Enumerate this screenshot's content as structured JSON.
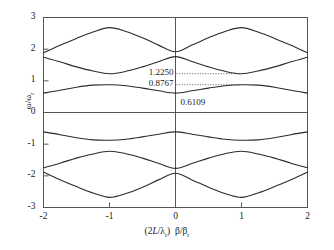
{
  "chart_data": {
    "type": "line",
    "title": "",
    "xlabel": "(2L/λ_r) β/β_r",
    "ylabel": "ω/ω_r",
    "xlim": [
      -2,
      2
    ],
    "ylim": [
      -3,
      3
    ],
    "xticks": [
      -2,
      -1,
      0,
      1,
      2
    ],
    "yticks": [
      3,
      2,
      1,
      0,
      -1,
      -2,
      -3
    ],
    "xtick_labels": [
      "-2",
      "-1",
      "0",
      "1",
      "2"
    ],
    "ytick_labels": [
      "3",
      "2",
      "1",
      "0",
      "-1",
      "-2",
      "-3"
    ],
    "grid": false,
    "legend": "none",
    "zero_line": 0,
    "series": [
      {
        "name": "band-1-upper",
        "x": [
          -2.0,
          -1.75,
          -1.5,
          -1.25,
          -1.0,
          -0.75,
          -0.5,
          -0.25,
          0.0,
          0.25,
          0.5,
          0.75,
          1.0,
          1.25,
          1.5,
          1.75,
          2.0
        ],
        "values": [
          1.88,
          2.12,
          2.34,
          2.54,
          2.68,
          2.56,
          2.36,
          2.12,
          1.92,
          2.13,
          2.36,
          2.56,
          2.68,
          2.54,
          2.34,
          2.12,
          1.88
        ]
      },
      {
        "name": "band-2-middle",
        "x": [
          -2.0,
          -1.75,
          -1.5,
          -1.25,
          -1.0,
          -0.75,
          -0.5,
          -0.25,
          0.0,
          0.25,
          0.5,
          0.75,
          1.0,
          1.25,
          1.5,
          1.75,
          2.0
        ],
        "values": [
          1.745,
          1.6,
          1.44,
          1.31,
          1.225,
          1.3,
          1.44,
          1.61,
          1.765,
          1.61,
          1.44,
          1.3,
          1.225,
          1.31,
          1.44,
          1.6,
          1.745
        ]
      },
      {
        "name": "band-3-lower",
        "x": [
          -2.0,
          -1.75,
          -1.5,
          -1.25,
          -1.0,
          -0.75,
          -0.5,
          -0.25,
          0.0,
          0.25,
          0.5,
          0.75,
          1.0,
          1.25,
          1.5,
          1.75,
          2.0
        ],
        "values": [
          0.6109,
          0.7,
          0.8,
          0.865,
          0.8767,
          0.845,
          0.77,
          0.685,
          0.6109,
          0.685,
          0.77,
          0.845,
          0.8767,
          0.865,
          0.8,
          0.7,
          0.6109
        ]
      },
      {
        "name": "band-3-lower-mirrored",
        "x": [
          -2.0,
          -1.75,
          -1.5,
          -1.25,
          -1.0,
          -0.75,
          -0.5,
          -0.25,
          0.0,
          0.25,
          0.5,
          0.75,
          1.0,
          1.25,
          1.5,
          1.75,
          2.0
        ],
        "values": [
          -0.6109,
          -0.7,
          -0.8,
          -0.865,
          -0.8767,
          -0.845,
          -0.77,
          -0.685,
          -0.6109,
          -0.685,
          -0.77,
          -0.845,
          -0.8767,
          -0.865,
          -0.8,
          -0.7,
          -0.6109
        ]
      },
      {
        "name": "band-2-middle-mirrored",
        "x": [
          -2.0,
          -1.75,
          -1.5,
          -1.25,
          -1.0,
          -0.75,
          -0.5,
          -0.25,
          0.0,
          0.25,
          0.5,
          0.75,
          1.0,
          1.25,
          1.5,
          1.75,
          2.0
        ],
        "values": [
          -1.745,
          -1.6,
          -1.44,
          -1.31,
          -1.225,
          -1.3,
          -1.44,
          -1.61,
          -1.765,
          -1.61,
          -1.44,
          -1.3,
          -1.225,
          -1.31,
          -1.44,
          -1.6,
          -1.745
        ]
      },
      {
        "name": "band-1-upper-mirrored",
        "x": [
          -2.0,
          -1.75,
          -1.5,
          -1.25,
          -1.0,
          -0.75,
          -0.5,
          -0.25,
          0.0,
          0.25,
          0.5,
          0.75,
          1.0,
          1.25,
          1.5,
          1.75,
          2.0
        ],
        "values": [
          -1.88,
          -2.12,
          -2.34,
          -2.54,
          -2.68,
          -2.56,
          -2.36,
          -2.12,
          -1.92,
          -2.13,
          -2.36,
          -2.56,
          -2.68,
          -2.54,
          -2.34,
          -2.12,
          -1.88
        ]
      }
    ],
    "annotations": [
      {
        "label": "1.2250",
        "value": 1.225,
        "leader": true,
        "leader_to_x": 1.0
      },
      {
        "label": "0.8767",
        "value": 0.8767,
        "leader": true,
        "leader_to_x": 1.0
      },
      {
        "label": "0.6109",
        "value": 0.6109,
        "leader": false,
        "leader_to_x": 0.0
      }
    ],
    "colors": {
      "curve": "#2b2b2b",
      "axis": "#555555",
      "frame": "#555555",
      "leader": "#333333",
      "background": "#ffffff"
    }
  },
  "axes": {
    "y_axis_label_main": "ω/ω",
    "y_axis_label_sub": "r",
    "x_axis_label_open": "(2",
    "x_axis_label_L": "L",
    "x_axis_label_slash": "/",
    "x_axis_label_lambda": "λ",
    "x_axis_label_lambda_sub": "r",
    "x_axis_label_close": ")",
    "x_axis_label_beta": "β",
    "x_axis_label_beta_slash": "/",
    "x_axis_label_beta2": "β",
    "x_axis_label_beta_sub": "r"
  }
}
